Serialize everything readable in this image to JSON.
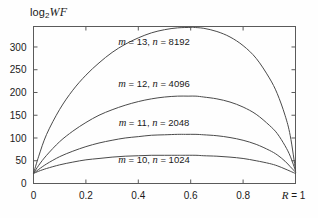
{
  "figure": {
    "y_axis_caption": "log",
    "y_axis_caption_sub": "2",
    "y_axis_caption_italic": "WF"
  },
  "chart_data": {
    "type": "line",
    "title": "",
    "subtitle": "",
    "xlabel": "R",
    "ylabel": "log2 WF",
    "xlim": [
      0,
      1
    ],
    "ylim": [
      0,
      345
    ],
    "grid": false,
    "legend_position": "inline-annotations",
    "x_ticks": [
      0,
      0.2,
      0.4,
      0.6,
      0.8,
      1
    ],
    "x_tick_labels": [
      "0",
      "0.2",
      "0.4",
      "0.6",
      "0.8",
      "R = 1"
    ],
    "y_ticks": [
      0,
      50,
      100,
      150,
      200,
      250,
      300
    ],
    "y_tick_labels": [
      "0",
      "50",
      "100",
      "150",
      "200",
      "250",
      "300"
    ],
    "series": [
      {
        "name": "m = 13, n = 8192",
        "m": 13,
        "n": 8192,
        "label": "m = 13, n = 8192",
        "label_m": "m",
        "label_n": "n",
        "label_text": " = 13,  = 8192",
        "peak_x": 0.61,
        "peak_y": 343,
        "x": [
          0,
          0.02,
          0.05,
          0.1,
          0.15,
          0.2,
          0.25,
          0.3,
          0.35,
          0.4,
          0.45,
          0.5,
          0.55,
          0.6,
          0.61,
          0.65,
          0.7,
          0.75,
          0.8,
          0.85,
          0.9,
          0.93,
          0.96,
          0.98,
          1
        ],
        "y": [
          22,
          60,
          108,
          163,
          205,
          238,
          265,
          288,
          306,
          320,
          331,
          338,
          342,
          343,
          343,
          341,
          334,
          322,
          303,
          275,
          232,
          198,
          150,
          105,
          30
        ]
      },
      {
        "name": "m = 12, n = 4096",
        "m": 12,
        "n": 4096,
        "label": "m = 12, n = 4096",
        "label_m": "m",
        "label_n": "n",
        "label_text": " = 12,  = 4096",
        "peak_x": 0.59,
        "peak_y": 192,
        "x": [
          0,
          0.02,
          0.05,
          0.1,
          0.15,
          0.2,
          0.25,
          0.3,
          0.35,
          0.4,
          0.45,
          0.5,
          0.55,
          0.59,
          0.62,
          0.65,
          0.7,
          0.75,
          0.8,
          0.85,
          0.9,
          0.93,
          0.96,
          0.98,
          1
        ],
        "y": [
          22,
          40,
          62,
          92,
          115,
          134,
          150,
          162,
          172,
          180,
          186,
          190,
          192,
          192,
          192,
          190,
          186,
          179,
          168,
          152,
          128,
          110,
          83,
          60,
          28
        ]
      },
      {
        "name": "m = 11, n = 2048",
        "m": 11,
        "n": 2048,
        "label": "m = 11, n = 2048",
        "label_m": "m",
        "label_n": "n",
        "label_text": " = 11,  = 2048",
        "peak_x": 0.58,
        "peak_y": 108,
        "x": [
          0,
          0.02,
          0.05,
          0.1,
          0.15,
          0.2,
          0.25,
          0.3,
          0.35,
          0.4,
          0.45,
          0.5,
          0.55,
          0.58,
          0.62,
          0.65,
          0.7,
          0.75,
          0.8,
          0.85,
          0.9,
          0.93,
          0.96,
          0.98,
          1
        ],
        "y": [
          22,
          31,
          43,
          59,
          71,
          81,
          89,
          95,
          100,
          103,
          106,
          107,
          108,
          108,
          108,
          107,
          105,
          101,
          95,
          86,
          73,
          63,
          49,
          37,
          25
        ]
      },
      {
        "name": "m = 10, n = 1024",
        "m": 10,
        "n": 1024,
        "label": "m = 10, n = 1024",
        "label_m": "m",
        "label_n": "n",
        "label_text": " = 10,  = 1024",
        "peak_x": 0.57,
        "peak_y": 62,
        "x": [
          0,
          0.02,
          0.05,
          0.1,
          0.15,
          0.2,
          0.25,
          0.3,
          0.35,
          0.4,
          0.45,
          0.5,
          0.55,
          0.57,
          0.62,
          0.65,
          0.7,
          0.75,
          0.8,
          0.85,
          0.9,
          0.93,
          0.96,
          0.98,
          1
        ],
        "y": [
          22,
          27,
          33,
          41,
          47,
          52,
          55,
          58,
          60,
          61,
          62,
          62,
          62,
          62,
          62,
          61,
          60,
          58,
          55,
          50,
          44,
          39,
          32,
          27,
          22
        ]
      }
    ],
    "annotations": [
      {
        "text": "m = 13, n = 8192",
        "x": 0.46,
        "y": 305
      },
      {
        "text": "m = 12, n = 4096",
        "x": 0.46,
        "y": 213
      },
      {
        "text": "m = 11, n = 2048",
        "x": 0.46,
        "y": 127
      },
      {
        "text": "m = 10, n = 1024",
        "x": 0.46,
        "y": 45
      }
    ]
  }
}
